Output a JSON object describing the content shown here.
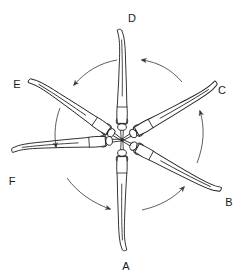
{
  "diagram": {
    "center": [
      122,
      140
    ],
    "positions": [
      {
        "id": "A",
        "label": "A",
        "angle_deg": 90,
        "label_pos": [
          126,
          265
        ]
      },
      {
        "id": "B",
        "label": "B",
        "angle_deg": 30,
        "label_pos": [
          229,
          202
        ]
      },
      {
        "id": "C",
        "label": "C",
        "angle_deg": -30,
        "label_pos": [
          222,
          90
        ]
      },
      {
        "id": "D",
        "label": "D",
        "angle_deg": -90,
        "label_pos": [
          132,
          18
        ]
      },
      {
        "id": "E",
        "label": "E",
        "angle_deg": -150,
        "label_pos": [
          17,
          84
        ]
      },
      {
        "id": "F",
        "label": "F",
        "angle_deg": 150,
        "label_pos": [
          12,
          181
        ]
      }
    ],
    "arrows": [
      {
        "from": "A",
        "to": "B",
        "direction": "counter-clockwise"
      },
      {
        "from": "B",
        "to": "C",
        "direction": "counter-clockwise"
      },
      {
        "from": "C",
        "to": "D",
        "direction": "counter-clockwise"
      },
      {
        "from": "D",
        "to": "E",
        "direction": "counter-clockwise"
      },
      {
        "from": "E",
        "to": "F",
        "direction": "counter-clockwise"
      },
      {
        "from": "F",
        "to": "A",
        "direction": "counter-clockwise"
      }
    ],
    "colors": {
      "line": "#1f1f1f",
      "arrow": "#333333",
      "background": "#ffffff"
    }
  }
}
